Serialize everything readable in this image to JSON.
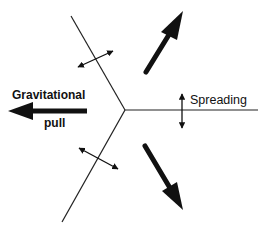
{
  "diagram": {
    "type": "plate-triple-junction-forces",
    "labels": {
      "gravitational_line1": "Gravitational",
      "gravitational_line2": "pull",
      "spreading": "Spreading"
    },
    "colors": {
      "ink": "#111111",
      "background": "#ffffff"
    },
    "junction": {
      "x": 125,
      "y": 110
    },
    "boundaries": [
      {
        "name": "upper-left-ridge",
        "from": [
          125,
          110
        ],
        "to": [
          71,
          16
        ]
      },
      {
        "name": "lower-left-ridge",
        "from": [
          125,
          110
        ],
        "to": [
          62,
          222
        ]
      },
      {
        "name": "right-ridge",
        "from": [
          125,
          110
        ],
        "to": [
          258,
          110
        ]
      }
    ],
    "bold_arrows": [
      {
        "name": "gravitational-pull-arrow",
        "tail": [
          87,
          111
        ],
        "tip": [
          9,
          111
        ]
      },
      {
        "name": "upper-right-motion-arrow",
        "tail": [
          145,
          73
        ],
        "tip": [
          183,
          11
        ]
      },
      {
        "name": "lower-right-motion-arrow",
        "tail": [
          144,
          146
        ],
        "tip": [
          183,
          210
        ]
      }
    ],
    "double_arrows": [
      {
        "name": "spreading-double-arrow",
        "from": [
          182,
          92
        ],
        "to": [
          182,
          130
        ]
      },
      {
        "name": "upper-left-spreading-double-arrow",
        "from": [
          76,
          68
        ],
        "to": [
          114,
          50
        ]
      },
      {
        "name": "lower-left-spreading-double-arrow",
        "from": [
          77,
          147
        ],
        "to": [
          119,
          170
        ]
      }
    ]
  }
}
